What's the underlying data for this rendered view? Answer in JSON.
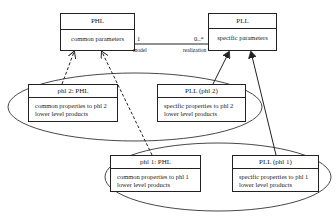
{
  "diagram": {
    "classes": [
      {
        "id": "phl",
        "title": "PHL",
        "body": [
          "common parameters"
        ]
      },
      {
        "id": "pll",
        "title": "PLL",
        "body": [
          "specific parameters"
        ]
      },
      {
        "id": "phl2",
        "title": "phl 2: PHL",
        "body": [
          "common properties to phl 2",
          "lower level products"
        ]
      },
      {
        "id": "pll_phl2",
        "title": "PLL (phl 2)",
        "body": [
          "specific properties to phl 2",
          "lower level products"
        ]
      },
      {
        "id": "phl1",
        "title": "phl 1: PHL",
        "body": [
          "common properties to phl 1",
          "lower level products"
        ]
      },
      {
        "id": "pll_phl1",
        "title": "PLL (phl 1)",
        "body": [
          "specific properties to phl 1",
          "lower level products"
        ]
      }
    ],
    "association": {
      "from": "phl",
      "to": "pll",
      "from_multiplicity": "1",
      "to_multiplicity": "0..*",
      "from_role": "model",
      "to_role": "realization"
    },
    "relations": [
      {
        "from": "phl2",
        "to": "phl",
        "style": "dashed-arrow"
      },
      {
        "from": "phl1",
        "to": "phl",
        "style": "dashed-arrow"
      },
      {
        "from": "pll_phl2",
        "to": "pll",
        "style": "solid-arrow"
      },
      {
        "from": "pll_phl1",
        "to": "pll",
        "style": "solid-arrow"
      }
    ],
    "groups": [
      {
        "members": [
          "phl2",
          "pll_phl2"
        ],
        "shape": "ellipse"
      },
      {
        "members": [
          "phl1",
          "pll_phl1"
        ],
        "shape": "ellipse"
      }
    ]
  }
}
